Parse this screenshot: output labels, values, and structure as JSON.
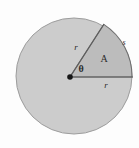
{
  "figure": {
    "name": "circle-sector-diagram",
    "type": "geometry-diagram",
    "background_color": "#fdfdfd",
    "circle": {
      "fill_color": "#cccccc",
      "stroke_color": "#9a9a9a",
      "center_x": 74,
      "center_y": 76,
      "radius": 58
    },
    "sector": {
      "fill_color": "#bdbdbd",
      "stroke_color": "#6e6e6e",
      "start_angle_deg": 0,
      "end_angle_deg": 57,
      "vertex_x": 70,
      "vertex_y": 77
    },
    "center_dot": {
      "color": "#1a1a1a",
      "radius": 2.6
    },
    "labels": {
      "radius_upper": "r",
      "radius_lower": "r",
      "angle": "θ",
      "area": "A",
      "arc_length": "s"
    }
  }
}
